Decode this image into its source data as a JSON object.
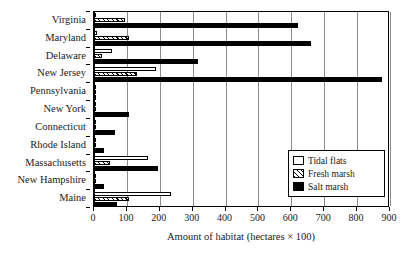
{
  "chart_data": {
    "type": "bar",
    "orientation": "horizontal",
    "title": "",
    "xlabel": "Amount of habitat (hectares × 100)",
    "ylabel": "",
    "xlim": [
      0,
      900
    ],
    "xticks": [
      0,
      100,
      200,
      300,
      400,
      500,
      600,
      700,
      800,
      900
    ],
    "xticklabels": [
      "0",
      "100",
      "200",
      "300",
      "400",
      "500",
      "600",
      "700",
      "800",
      "900"
    ],
    "grid": "vertical",
    "legend_position": "right-inside",
    "categories": [
      "Virginia",
      "Maryland",
      "Delaware",
      "New Jersey",
      "Pennsylvania",
      "New York",
      "Connecticut",
      "Rhode Island",
      "Massachusetts",
      "New Hampshire",
      "Maine"
    ],
    "series": [
      {
        "name": "Tidal flats",
        "key": "tidal",
        "style": "open",
        "values": [
          3,
          8,
          55,
          190,
          2,
          4,
          1,
          2,
          165,
          1,
          235
        ]
      },
      {
        "name": "Fresh marsh",
        "key": "fresh",
        "style": "hatched",
        "values": [
          95,
          105,
          25,
          130,
          1,
          3,
          1,
          1,
          50,
          1,
          105
        ]
      },
      {
        "name": "Salt marsh",
        "key": "salt",
        "style": "filled",
        "values": [
          620,
          660,
          315,
          875,
          1,
          105,
          65,
          30,
          195,
          30,
          70
        ]
      }
    ]
  },
  "legend": {
    "items": [
      {
        "label": "Tidal flats",
        "key": "tidal"
      },
      {
        "label": "Fresh marsh",
        "key": "fresh"
      },
      {
        "label": "Salt marsh",
        "key": "salt"
      }
    ]
  },
  "colors": {
    "axis": "#000000",
    "grid": "#8c8c8c",
    "salt_marsh": "#000000",
    "tidal_flats": "#ffffff",
    "background": "#ffffff"
  }
}
